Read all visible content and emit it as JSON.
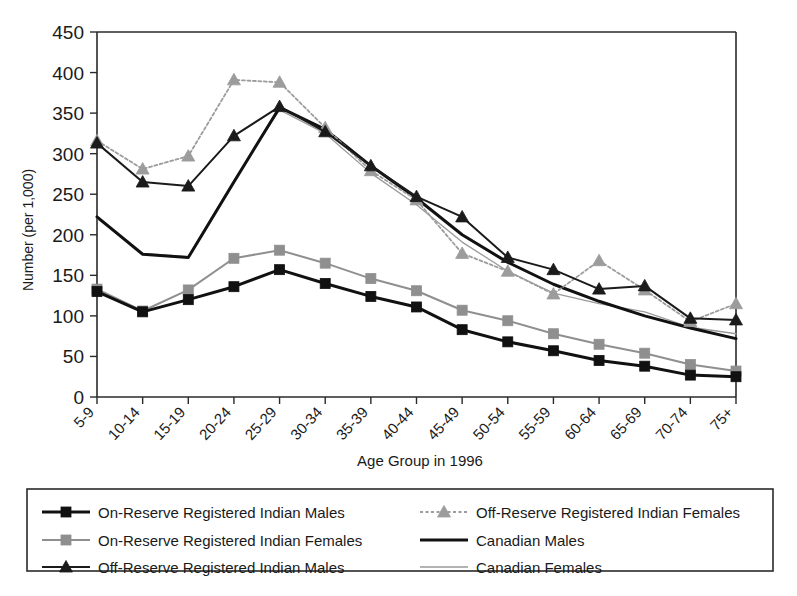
{
  "chart_data": {
    "type": "line",
    "title": "",
    "xlabel": "Age Group in 1996",
    "ylabel": "Number (per 1,000)",
    "ylim": [
      0,
      450
    ],
    "ytick_step": 50,
    "grid": false,
    "legend_position": "bottom",
    "categories": [
      "5-9",
      "10-14",
      "15-19",
      "20-24",
      "25-29",
      "30-34",
      "35-39",
      "40-44",
      "45-49",
      "50-54",
      "55-59",
      "60-64",
      "65-69",
      "70-74",
      "75+"
    ],
    "yticks": [
      0,
      50,
      100,
      150,
      200,
      250,
      300,
      350,
      400,
      450
    ],
    "series": [
      {
        "name": "On-Reserve Registered Indian Males",
        "marker": "square",
        "color": "#111111",
        "line_style": "solid-thick",
        "values": [
          130,
          105,
          120,
          136,
          157,
          140,
          124,
          111,
          83,
          68,
          57,
          45,
          38,
          27,
          25
        ]
      },
      {
        "name": "On-Reserve Registered Indian Females",
        "marker": "square",
        "color": "#8f8f8f",
        "line_style": "solid-medium",
        "values": [
          133,
          106,
          132,
          171,
          181,
          165,
          146,
          131,
          107,
          94,
          78,
          65,
          54,
          40,
          32
        ]
      },
      {
        "name": "Off-Reserve Registered Indian Males",
        "marker": "triangle",
        "color": "#1b1b1b",
        "line_style": "solid-medium",
        "values": [
          313,
          265,
          260,
          322,
          358,
          327,
          285,
          247,
          222,
          172,
          157,
          133,
          137,
          97,
          95
        ]
      },
      {
        "name": "Off-Reserve Registered Indian Females",
        "marker": "triangle",
        "color": "#9c9c9c",
        "line_style": "dotted",
        "values": [
          316,
          281,
          297,
          391,
          388,
          332,
          279,
          243,
          177,
          155,
          127,
          168,
          132,
          93,
          115
        ]
      },
      {
        "name": "Canadian Males",
        "marker": "none",
        "color": "#111111",
        "line_style": "solid-thick",
        "values": [
          222,
          176,
          172,
          265,
          357,
          330,
          285,
          245,
          200,
          166,
          139,
          118,
          100,
          85,
          72
        ]
      },
      {
        "name": "Canadian Females",
        "marker": "none",
        "color": "#9a9a9a",
        "line_style": "thin",
        "values": [
          220,
          177,
          173,
          267,
          354,
          325,
          276,
          237,
          191,
          155,
          128,
          115,
          105,
          86,
          78
        ]
      }
    ]
  },
  "axes": {
    "x_title": "Age Group in 1996",
    "y_title": "Number (per 1,000)"
  },
  "legend": {
    "entries": [
      {
        "label": "On-Reserve Registered Indian Males",
        "marker": "square",
        "color": "#111111",
        "style": "solid-thick"
      },
      {
        "label": "On-Reserve Registered Indian Females",
        "marker": "square",
        "color": "#8f8f8f",
        "style": "solid-medium"
      },
      {
        "label": "Off-Reserve Registered Indian Males",
        "marker": "triangle",
        "color": "#1b1b1b",
        "style": "solid-medium"
      },
      {
        "label": "Off-Reserve Registered Indian Females",
        "marker": "triangle",
        "color": "#9c9c9c",
        "style": "dotted"
      },
      {
        "label": "Canadian Males",
        "marker": "none",
        "color": "#111111",
        "style": "solid-thick"
      },
      {
        "label": "Canadian Females",
        "marker": "none",
        "color": "#9a9a9a",
        "style": "thin"
      }
    ]
  },
  "colors": {
    "axis": "#2a2a2a",
    "background": "#ffffff",
    "dark_series": "#111111",
    "light_series": "#9a9a9a"
  }
}
